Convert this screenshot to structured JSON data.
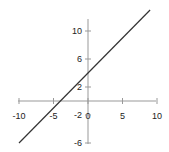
{
  "chart_data": {
    "type": "line",
    "title": "",
    "xlabel": "",
    "ylabel": "",
    "xlim": [
      -10,
      10
    ],
    "ylim": [
      -6,
      11.5
    ],
    "grid": false,
    "x_ticks": [
      -10,
      -5,
      0,
      5,
      10
    ],
    "x_tick_labels": [
      "-10",
      "-5",
      "0",
      "5",
      "10"
    ],
    "y_ticks": [
      -6,
      -2,
      2,
      6,
      10
    ],
    "y_tick_labels": [
      "-6",
      "-2",
      "2",
      "6",
      "10"
    ],
    "series": [
      {
        "name": "y = x + 4",
        "x": [
          -10,
          9
        ],
        "y": [
          -6,
          13
        ],
        "color": "#333333"
      }
    ],
    "axis_color": "#999999"
  }
}
